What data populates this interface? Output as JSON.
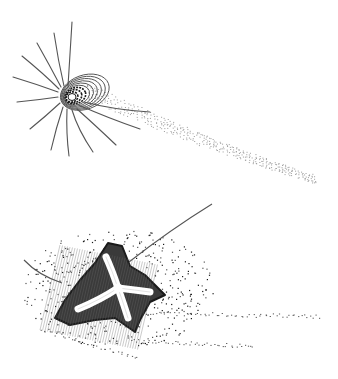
{
  "figure": {
    "width": 338,
    "height": 379,
    "background": "#ffffff",
    "ink": "#1a1a1a",
    "grey": "#555555",
    "light": "#9a9a9a"
  },
  "top_panel": {
    "name": "vortex-ring-with-spokes",
    "center": [
      72,
      97
    ],
    "rings": {
      "count": 9,
      "rx0": 6,
      "ry0": 5,
      "step_x": 2.4,
      "step_y": 1.5,
      "shift_x": 1.6,
      "shift_y": -0.6,
      "rotation": -20
    },
    "spokes": [
      [
        [
          68,
          86
        ],
        [
          70,
          55
        ],
        [
          72,
          22
        ]
      ],
      [
        [
          64,
          86
        ],
        [
          58,
          60
        ],
        [
          54,
          33
        ]
      ],
      [
        [
          61,
          87
        ],
        [
          50,
          66
        ],
        [
          37,
          43
        ]
      ],
      [
        [
          59,
          89
        ],
        [
          44,
          74
        ],
        [
          22,
          56
        ]
      ],
      [
        [
          58,
          92
        ],
        [
          36,
          84
        ],
        [
          13,
          77
        ]
      ],
      [
        [
          58,
          97
        ],
        [
          38,
          100
        ],
        [
          17,
          102
        ]
      ],
      [
        [
          60,
          103
        ],
        [
          46,
          116
        ],
        [
          30,
          129
        ]
      ],
      [
        [
          63,
          107
        ],
        [
          56,
          128
        ],
        [
          51,
          150
        ]
      ],
      [
        [
          67,
          109
        ],
        [
          66,
          133
        ],
        [
          69,
          156
        ]
      ],
      [
        [
          72,
          110
        ],
        [
          78,
          130
        ],
        [
          93,
          152
        ]
      ],
      [
        [
          77,
          109
        ],
        [
          95,
          125
        ],
        [
          116,
          145
        ]
      ],
      [
        [
          81,
          106
        ],
        [
          108,
          118
        ],
        [
          140,
          129
        ]
      ],
      [
        [
          84,
          102
        ],
        [
          115,
          110
        ],
        [
          150,
          112
        ]
      ]
    ],
    "trail": {
      "from": [
        88,
        92
      ],
      "to": [
        318,
        180
      ],
      "rows": 7,
      "spread": 18,
      "dots_per_row": 70
    }
  },
  "bottom_panel": {
    "name": "four-armed-star-vortex",
    "center": [
      118,
      288
    ],
    "body": [
      [
        108,
        243
      ],
      [
        122,
        246
      ],
      [
        130,
        266
      ],
      [
        145,
        275
      ],
      [
        165,
        295
      ],
      [
        150,
        302
      ],
      [
        140,
        320
      ],
      [
        135,
        332
      ],
      [
        115,
        318
      ],
      [
        95,
        320
      ],
      [
        70,
        325
      ],
      [
        55,
        318
      ],
      [
        65,
        300
      ],
      [
        80,
        280
      ],
      [
        95,
        263
      ]
    ],
    "arms": [
      [
        [
          118,
          288
        ],
        [
          112,
          270
        ],
        [
          106,
          257
        ]
      ],
      [
        [
          118,
          288
        ],
        [
          135,
          290
        ],
        [
          150,
          292
        ]
      ],
      [
        [
          118,
          288
        ],
        [
          124,
          305
        ],
        [
          128,
          318
        ]
      ],
      [
        [
          118,
          288
        ],
        [
          100,
          300
        ],
        [
          78,
          309
        ]
      ]
    ],
    "filaments": [
      [
        [
          24,
          260
        ],
        [
          38,
          275
        ],
        [
          62,
          283
        ]
      ],
      [
        [
          129,
          262
        ],
        [
          170,
          230
        ],
        [
          212,
          204
        ]
      ]
    ],
    "streams": [
      {
        "from": [
          140,
          313
        ],
        "to": [
          322,
          316
        ],
        "dots": 60
      },
      {
        "from": [
          130,
          340
        ],
        "to": [
          255,
          346
        ],
        "dots": 45
      },
      {
        "from": [
          40,
          330
        ],
        "to": [
          140,
          358
        ],
        "dots": 35
      }
    ],
    "scatter_count": 420
  }
}
